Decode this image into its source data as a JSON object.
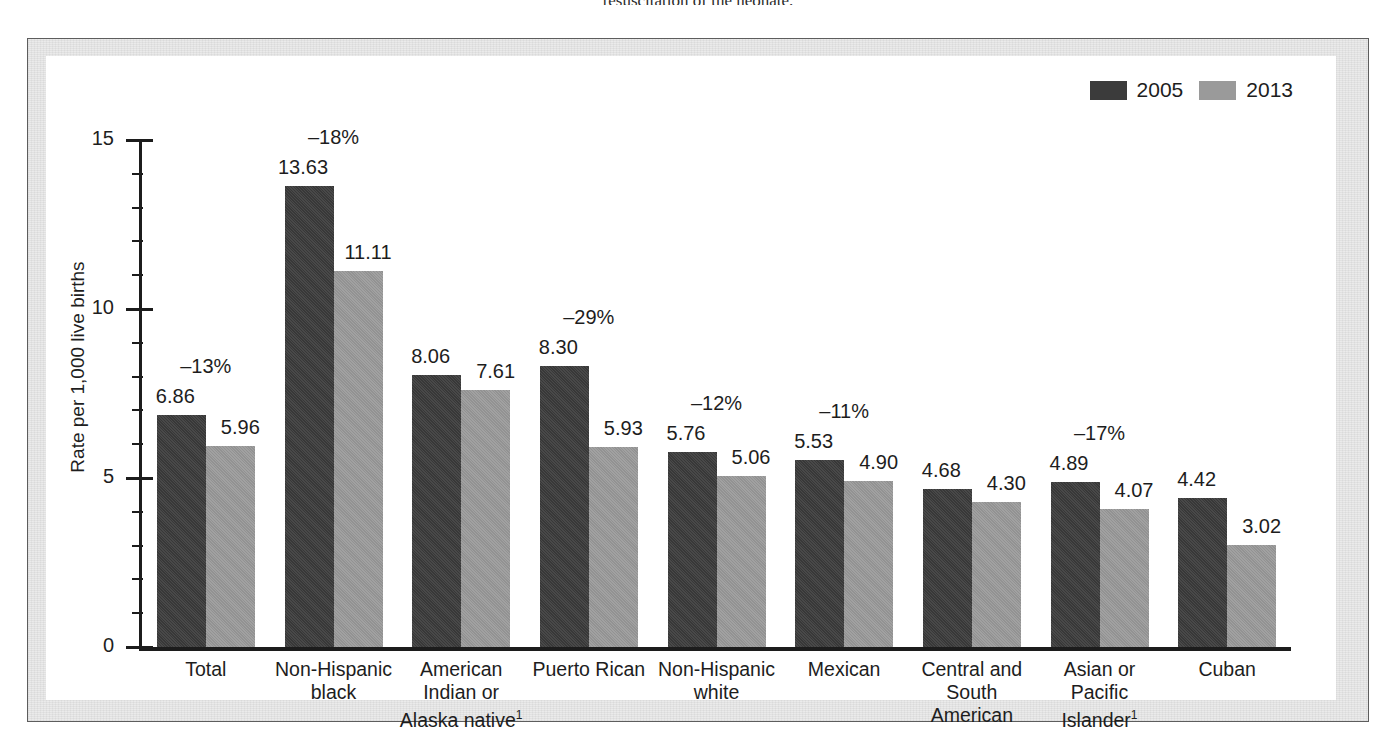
{
  "page": {
    "top_text_fragment": "resuscitation of the neonate."
  },
  "legend": {
    "items": [
      {
        "label": "2005",
        "color": "#3b3b3b",
        "name": "legend-swatch-2005"
      },
      {
        "label": "2013",
        "color": "#9a9a9a",
        "name": "legend-swatch-2013"
      }
    ]
  },
  "axis": {
    "y_title": "Rate per 1,000 live births",
    "y_ticks": [
      "0",
      "5",
      "10",
      "15"
    ]
  },
  "chart_data": {
    "type": "bar",
    "title": "",
    "subtitle": "",
    "xlabel": "",
    "ylabel": "Rate per 1,000 live births",
    "ylim": [
      0,
      15
    ],
    "yticks": [
      0,
      5,
      10,
      15
    ],
    "yminor_step": 1,
    "grid": false,
    "legend_position": "top-right",
    "categories": [
      "Total",
      "Non-Hispanic black",
      "American Indian or Alaska native¹",
      "Puerto Rican",
      "Non-Hispanic white",
      "Mexican",
      "Central and South American",
      "Asian or Pacific Islander¹",
      "Cuban"
    ],
    "category_lines": [
      [
        "Total"
      ],
      [
        "Non-Hispanic",
        "black"
      ],
      [
        "American",
        "Indian or",
        "Alaska native¹"
      ],
      [
        "Puerto Rican"
      ],
      [
        "Non-Hispanic",
        "white"
      ],
      [
        "Mexican"
      ],
      [
        "Central and",
        "South",
        "American"
      ],
      [
        "Asian or",
        "Pacific",
        "Islander¹"
      ],
      [
        "Cuban"
      ]
    ],
    "series": [
      {
        "name": "2005",
        "color": "#3b3b3b",
        "values": [
          6.86,
          13.63,
          8.06,
          8.3,
          5.76,
          5.53,
          4.68,
          4.89,
          4.42
        ]
      },
      {
        "name": "2013",
        "color": "#9a9a9a",
        "values": [
          5.96,
          11.11,
          7.61,
          5.93,
          5.06,
          4.9,
          4.3,
          4.07,
          3.02
        ]
      }
    ],
    "value_labels_2005": [
      "6.86",
      "13.63",
      "8.06",
      "8.30",
      "5.76",
      "5.53",
      "4.68",
      "4.89",
      "4.42"
    ],
    "value_labels_2013": [
      "5.96",
      "11.11",
      "7.61",
      "5.93",
      "5.06",
      "4.90",
      "4.30",
      "4.07",
      "3.02"
    ],
    "percent_change_labels": [
      "–13%",
      "–18%",
      "",
      "–29%",
      "–12%",
      "–11%",
      "",
      "–17%",
      ""
    ]
  }
}
